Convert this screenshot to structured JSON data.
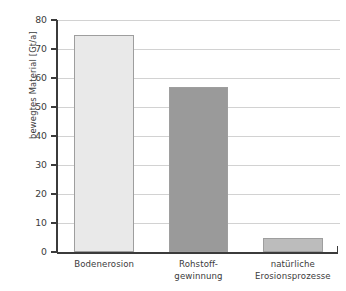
{
  "chart_data": {
    "type": "bar",
    "title": "",
    "xlabel": "",
    "ylabel": "bewegtes Material [Gt/a]",
    "ylim": [
      0,
      80
    ],
    "grid": true,
    "legend": "none",
    "categories": [
      "Bodenerosion",
      "Rohstoff-\ngewinnung",
      "natürliche\nErosionsprozesse"
    ],
    "category_lines": [
      [
        "Bodenerosion"
      ],
      [
        "Rohstoff-",
        "gewinnung"
      ],
      [
        "natürliche",
        "Erosionsprozesse"
      ]
    ],
    "values": [
      75,
      57,
      5
    ],
    "yticks": [
      0,
      10,
      20,
      30,
      40,
      50,
      60,
      70,
      80
    ],
    "ytick_labels": [
      "0",
      "10",
      "20",
      "30",
      "40",
      "50",
      "60",
      "70",
      "80"
    ],
    "bar_colors": [
      "#e9e9e9",
      "#9a9a9a",
      "#bcbcbc"
    ],
    "bar_border_color": "#9e9e9e",
    "axis_color": "#3b3b3b",
    "grid_color": "#d2d2d2",
    "background_color": "#ffffff"
  },
  "axis": {
    "y_title": "bewegtes Material [Gt/a]"
  }
}
